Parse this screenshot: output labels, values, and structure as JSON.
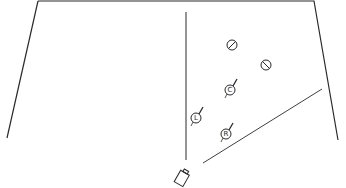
{
  "diagram": {
    "type": "floor-plan",
    "stroke_color": "#2a2a2a",
    "background": "#ffffff",
    "room_outline": {
      "points": [
        [
          38,
          1
        ],
        [
          314,
          1
        ],
        [
          338,
          140
        ]
      ],
      "left_wall": [
        [
          38,
          1
        ],
        [
          7,
          138
        ]
      ]
    },
    "center_line": {
      "x": 186,
      "y1": 12,
      "y2": 160
    },
    "diagonal_line": {
      "x1": 203,
      "y1": 163,
      "x2": 322,
      "y2": 89
    },
    "fixtures": [
      {
        "id": "fixture-1",
        "type": "slashed-circle",
        "cx": 232,
        "cy": 45,
        "r": 5
      },
      {
        "id": "fixture-2",
        "type": "slashed-circle",
        "cx": 266,
        "cy": 65,
        "r": 5
      }
    ],
    "markers": [
      {
        "id": "marker-c",
        "letter": "C",
        "cx": 230,
        "cy": 90,
        "r": 5
      },
      {
        "id": "marker-l",
        "letter": "L",
        "cx": 196,
        "cy": 118,
        "r": 5
      },
      {
        "id": "marker-r",
        "letter": "R",
        "cx": 226,
        "cy": 134,
        "r": 5
      }
    ],
    "camera": {
      "x": 177,
      "y": 166,
      "label": ""
    }
  }
}
